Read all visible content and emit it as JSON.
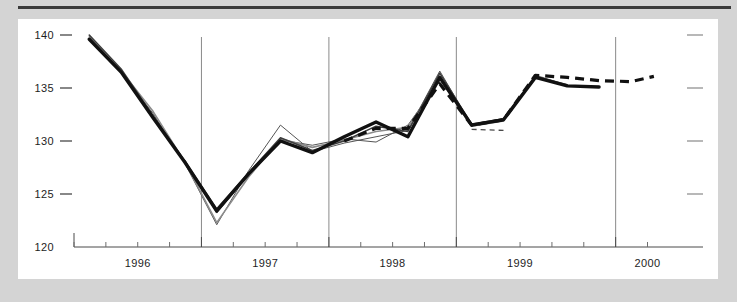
{
  "chart_data": {
    "type": "line",
    "title": "",
    "subtitle": "",
    "xlabel": "",
    "ylabel": "",
    "xlim": [
      1995.5,
      2000.2
    ],
    "ylim": [
      120,
      140
    ],
    "yticks": [
      120,
      125,
      130,
      135,
      140
    ],
    "ytick_labels": [
      "120",
      "125",
      "130",
      "135",
      "140"
    ],
    "xticks": [
      1996,
      1997,
      1998,
      1999,
      2000
    ],
    "xtick_labels": [
      "1996",
      "1997",
      "1998",
      "1999",
      "2000"
    ],
    "xminor_step": 0.25,
    "gridlines_x": [
      1996.5,
      1997.5,
      1998.5,
      1999.75
    ],
    "grid": "vertical-only",
    "right_axis_ticks": [
      125,
      130,
      135,
      140
    ],
    "legend": "none",
    "series": [
      {
        "name": "actual-bold",
        "style": "solid-bold",
        "color": "#111111",
        "x": [
          1995.62,
          1995.87,
          1996.12,
          1996.37,
          1996.62,
          1996.87,
          1997.12,
          1997.37,
          1997.62,
          1997.87,
          1998.12,
          1998.37,
          1998.62,
          1998.87,
          1999.12,
          1999.37,
          1999.62
        ],
        "y": [
          139.6,
          136.5,
          132.2,
          128.0,
          123.4,
          126.9,
          130.0,
          128.9,
          130.4,
          131.8,
          130.4,
          136.0,
          131.5,
          132.0,
          136.0,
          135.2,
          135.1
        ]
      },
      {
        "name": "variant-mid",
        "style": "solid-mid",
        "color": "#3d3d3d",
        "x": [
          1995.62,
          1995.87,
          1996.12,
          1996.37,
          1996.62,
          1996.87,
          1997.12,
          1997.37,
          1997.62,
          1997.87,
          1998.12,
          1998.37,
          1998.62,
          1998.87,
          1999.12,
          1999.37
        ],
        "y": [
          140.0,
          136.8,
          132.4,
          128.1,
          123.6,
          127.0,
          130.3,
          129.1,
          130.0,
          131.4,
          130.9,
          136.4,
          131.6,
          132.1,
          136.1,
          135.3
        ]
      },
      {
        "name": "variant-grey",
        "style": "solid-grey",
        "color": "#8c8c8c",
        "x": [
          1995.62,
          1995.87,
          1996.12,
          1996.37,
          1996.62,
          1996.87,
          1997.12,
          1997.37,
          1997.62,
          1997.87,
          1998.12,
          1998.37,
          1998.62,
          1998.87,
          1999.12,
          1999.37
        ],
        "y": [
          139.8,
          136.6,
          132.8,
          128.0,
          122.3,
          126.6,
          130.2,
          129.4,
          130.1,
          130.9,
          131.3,
          135.9,
          131.4,
          131.9,
          136.2,
          135.2
        ]
      },
      {
        "name": "variant-thin-a",
        "style": "solid-thin",
        "color": "#555555",
        "x": [
          1995.62,
          1995.87,
          1996.12,
          1996.37,
          1996.62,
          1996.87,
          1997.12,
          1997.37,
          1997.62,
          1997.87,
          1998.12,
          1998.37,
          1998.62
        ],
        "y": [
          139.9,
          136.4,
          132.6,
          127.9,
          122.1,
          127.2,
          131.5,
          129.0,
          129.8,
          130.4,
          131.0,
          136.6,
          131.5
        ]
      },
      {
        "name": "variant-thin-b",
        "style": "solid-thin",
        "color": "#555555",
        "x": [
          1996.37,
          1996.62,
          1996.87,
          1997.12,
          1997.37,
          1997.62,
          1997.87,
          1998.12,
          1998.37
        ],
        "y": [
          128.2,
          123.2,
          126.8,
          130.1,
          129.6,
          130.2,
          129.9,
          131.5,
          135.7
        ]
      },
      {
        "name": "forecast-bold-dashed",
        "style": "dashed-bold",
        "color": "#111111",
        "x": [
          1997.62,
          1997.87,
          1998.12,
          1998.37,
          1998.62,
          1998.87,
          1999.12,
          1999.37,
          1999.62,
          1999.87,
          2000.05
        ],
        "y": [
          130.0,
          131.2,
          131.2,
          135.4,
          131.5,
          132.0,
          136.2,
          136.0,
          135.7,
          135.6,
          136.1
        ]
      },
      {
        "name": "forecast-thin-dashed",
        "style": "dashed-thin",
        "color": "#4a4a4a",
        "x": [
          1998.62,
          1998.87
        ],
        "y": [
          131.1,
          131.0
        ]
      }
    ]
  },
  "axes": {
    "y_axis_name": "value-axis",
    "x_axis_name": "time-axis"
  }
}
